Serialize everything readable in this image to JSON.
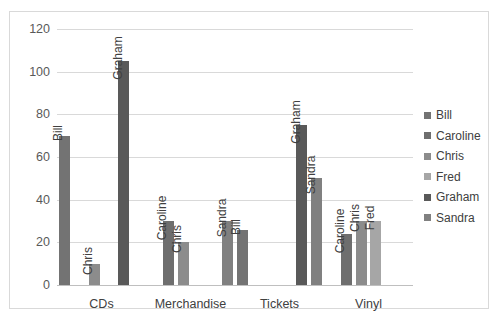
{
  "chart_data": {
    "type": "bar",
    "title": "",
    "xlabel": "",
    "ylabel": "",
    "ylim": [
      0,
      120
    ],
    "ytick_step": 20,
    "yticks": [
      "0",
      "20",
      "40",
      "60",
      "80",
      "100",
      "120"
    ],
    "grid": true,
    "legend_position": "right",
    "categories": [
      "CDs",
      "Merchandise",
      "Tickets",
      "Vinyl"
    ],
    "series": [
      {
        "name": "Bill",
        "color": "#737373",
        "values": [
          70,
          null,
          26,
          null
        ]
      },
      {
        "name": "Caroline",
        "color": "#6E6E6E",
        "values": [
          null,
          30,
          null,
          24
        ]
      },
      {
        "name": "Chris",
        "color": "#8C8C8C",
        "values": [
          10,
          20,
          null,
          30
        ]
      },
      {
        "name": "Fred",
        "color": "#A6A6A6",
        "values": [
          null,
          null,
          null,
          30
        ]
      },
      {
        "name": "Graham",
        "color": "#595959",
        "values": [
          105,
          null,
          75,
          null
        ]
      },
      {
        "name": "Sandra",
        "color": "#808080",
        "values": [
          null,
          30,
          50,
          null
        ]
      }
    ],
    "bar_labels": [
      [
        "Bill",
        "Chris",
        "Graham"
      ],
      [
        "Caroline",
        "Chris",
        "Sandra"
      ],
      [
        "Bill",
        "Graham",
        "Sandra"
      ],
      [
        "Caroline",
        "Chris",
        "Fred"
      ]
    ]
  },
  "legend": {
    "items": [
      {
        "label": "Bill",
        "color": "#737373"
      },
      {
        "label": "Caroline",
        "color": "#6E6E6E"
      },
      {
        "label": "Chris",
        "color": "#8C8C8C"
      },
      {
        "label": "Fred",
        "color": "#A6A6A6"
      },
      {
        "label": "Graham",
        "color": "#595959"
      },
      {
        "label": "Sandra",
        "color": "#808080"
      }
    ]
  },
  "axis": {
    "y_labels": [
      "120",
      "100",
      "80",
      "60",
      "40",
      "20",
      "0"
    ],
    "x_labels": [
      "CDs",
      "Merchandise",
      "Tickets",
      "Vinyl"
    ]
  }
}
